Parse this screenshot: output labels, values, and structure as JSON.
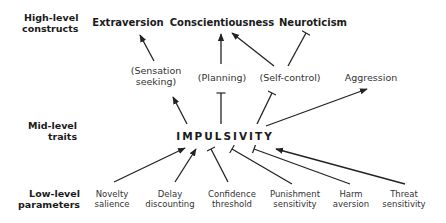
{
  "levels": {
    "high": [
      "High-level",
      "constructs"
    ],
    "mid": [
      "Mid-level",
      "traits"
    ],
    "low": [
      "Low-level",
      "parameters"
    ]
  },
  "nodes": {
    "extraversion": "Extraversion",
    "conscientiousness": "Conscientiousness",
    "neuroticism": "Neuroticism",
    "sensation_seeking": [
      "(Sensation",
      "seeking)"
    ],
    "planning": "(Planning)",
    "self_control": "(Self-control)",
    "aggression": "Aggression",
    "impulsivity": "IMPULSIVITY",
    "novelty_salience": [
      "Novelty",
      "salience"
    ],
    "delay_discounting": [
      "Delay",
      "discounting"
    ],
    "confidence_threshold": [
      "Confidence",
      "threshold"
    ],
    "punishment_sensitivity": [
      "Punishment",
      "sensitivity"
    ],
    "harm_aversion": [
      "Harm",
      "aversion"
    ],
    "threat_sensitivity": [
      "Threat",
      "sensitivity"
    ]
  },
  "edges": [
    {
      "from": "Sensation seeking",
      "to": "Extraversion",
      "type": "excitatory"
    },
    {
      "from": "Planning",
      "to": "Conscientiousness",
      "type": "excitatory"
    },
    {
      "from": "Self-control",
      "to": "Conscientiousness",
      "type": "excitatory"
    },
    {
      "from": "Self-control",
      "to": "Neuroticism",
      "type": "inhibitory"
    },
    {
      "from": "IMPULSIVITY",
      "to": "Sensation seeking",
      "type": "excitatory"
    },
    {
      "from": "IMPULSIVITY",
      "to": "Planning",
      "type": "inhibitory"
    },
    {
      "from": "IMPULSIVITY",
      "to": "Self-control",
      "type": "inhibitory"
    },
    {
      "from": "IMPULSIVITY",
      "to": "Aggression",
      "type": "excitatory"
    },
    {
      "from": "Novelty salience",
      "to": "IMPULSIVITY",
      "type": "excitatory"
    },
    {
      "from": "Delay discounting",
      "to": "IMPULSIVITY",
      "type": "excitatory"
    },
    {
      "from": "Confidence threshold",
      "to": "IMPULSIVITY",
      "type": "inhibitory"
    },
    {
      "from": "Punishment sensitivity",
      "to": "IMPULSIVITY",
      "type": "inhibitory"
    },
    {
      "from": "Harm aversion",
      "to": "IMPULSIVITY",
      "type": "inhibitory"
    },
    {
      "from": "Threat sensitivity",
      "to": "IMPULSIVITY",
      "type": "excitatory"
    }
  ]
}
